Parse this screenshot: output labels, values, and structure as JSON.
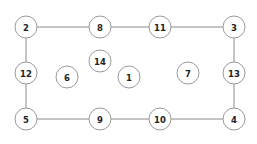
{
  "diagram": {
    "width": 257,
    "height": 144,
    "background_color": "#ffffff",
    "node_fill_color": "#ffffff",
    "node_stroke_color": "#9a9a9a",
    "edge_color": "#8a8a8a",
    "label_color": "#222222",
    "node_radius": 11,
    "nodes": [
      {
        "id": "n2",
        "label": "2",
        "cx": 26,
        "cy": 27,
        "r": 11
      },
      {
        "id": "n8",
        "label": "8",
        "cx": 100,
        "cy": 27,
        "r": 11
      },
      {
        "id": "n11",
        "label": "11",
        "cx": 160,
        "cy": 27,
        "r": 11
      },
      {
        "id": "n3",
        "label": "3",
        "cx": 234,
        "cy": 27,
        "r": 11
      },
      {
        "id": "n12",
        "label": "12",
        "cx": 26,
        "cy": 73,
        "r": 11
      },
      {
        "id": "n6",
        "label": "6",
        "cx": 67,
        "cy": 77,
        "r": 11
      },
      {
        "id": "n14",
        "label": "14",
        "cx": 100,
        "cy": 61,
        "r": 11
      },
      {
        "id": "n1",
        "label": "1",
        "cx": 129,
        "cy": 77,
        "r": 11
      },
      {
        "id": "n7",
        "label": "7",
        "cx": 188,
        "cy": 73,
        "r": 11
      },
      {
        "id": "n13",
        "label": "13",
        "cx": 234,
        "cy": 73,
        "r": 11
      },
      {
        "id": "n5",
        "label": "5",
        "cx": 26,
        "cy": 119,
        "r": 11
      },
      {
        "id": "n9",
        "label": "9",
        "cx": 100,
        "cy": 119,
        "r": 11
      },
      {
        "id": "n10",
        "label": "10",
        "cx": 160,
        "cy": 119,
        "r": 11
      },
      {
        "id": "n4",
        "label": "4",
        "cx": 234,
        "cy": 119,
        "r": 11
      }
    ],
    "edges": [
      {
        "id": "e2-8",
        "from": "2",
        "to": "8",
        "x1": 37,
        "y1": 27,
        "x2": 89,
        "y2": 27
      },
      {
        "id": "e8-11",
        "from": "8",
        "to": "11",
        "x1": 111,
        "y1": 27,
        "x2": 149,
        "y2": 27
      },
      {
        "id": "e11-3",
        "from": "11",
        "to": "3",
        "x1": 171,
        "y1": 27,
        "x2": 223,
        "y2": 27
      },
      {
        "id": "e2-12",
        "from": "2",
        "to": "12",
        "x1": 26,
        "y1": 38,
        "x2": 26,
        "y2": 62
      },
      {
        "id": "e12-5",
        "from": "12",
        "to": "5",
        "x1": 26,
        "y1": 84,
        "x2": 26,
        "y2": 108
      },
      {
        "id": "e3-13",
        "from": "3",
        "to": "13",
        "x1": 234,
        "y1": 38,
        "x2": 234,
        "y2": 62
      },
      {
        "id": "e13-4",
        "from": "13",
        "to": "4",
        "x1": 234,
        "y1": 84,
        "x2": 234,
        "y2": 108
      },
      {
        "id": "e5-9",
        "from": "5",
        "to": "9",
        "x1": 37,
        "y1": 119,
        "x2": 89,
        "y2": 119
      },
      {
        "id": "e9-10",
        "from": "9",
        "to": "10",
        "x1": 111,
        "y1": 119,
        "x2": 149,
        "y2": 119
      },
      {
        "id": "e10-4",
        "from": "10",
        "to": "4",
        "x1": 171,
        "y1": 119,
        "x2": 223,
        "y2": 119
      }
    ],
    "isolated_nodes": [
      "6",
      "14",
      "1",
      "7"
    ]
  }
}
